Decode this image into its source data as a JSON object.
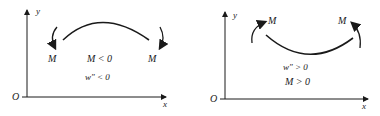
{
  "panels": [
    {
      "axis_y": "y",
      "axis_x": "x",
      "origin": "O",
      "moment_left": "M",
      "moment_right": "M",
      "condition_1": "M < 0",
      "condition_2": "w″ < 0",
      "curvature": "concave-down"
    },
    {
      "axis_y": "y",
      "axis_x": "x",
      "origin": "O",
      "moment_left": "M",
      "moment_right": "M",
      "condition_1": "w″ > 0",
      "condition_2": "M > 0",
      "curvature": "concave-up"
    }
  ],
  "colors": {
    "ink": "#1a1a1a",
    "background": "#ffffff"
  }
}
